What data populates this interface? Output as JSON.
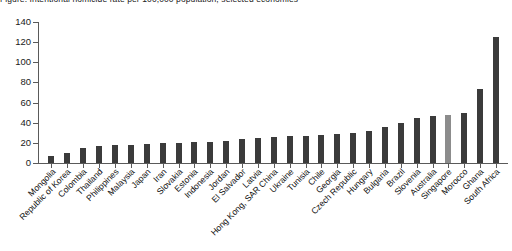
{
  "chart": {
    "title": "Figure: Intentional homicide rate per 100,000 population, selected economies",
    "axis": {
      "y_ticks": [
        0,
        20,
        40,
        60,
        80,
        100,
        120,
        140
      ],
      "ylim": [
        0,
        140
      ],
      "ylabel": "",
      "xlabel": ""
    },
    "colors": {
      "bar": "#3b3b3b",
      "bar_highlight": "#8c8c8c",
      "axis": "#5a5a5a",
      "text": "#111111",
      "background": "#ffffff"
    },
    "highlight_category": "Singapore"
  },
  "chart_data": {
    "type": "bar",
    "title": "Figure: Intentional homicide rate per 100,000 population, selected economies",
    "xlabel": "",
    "ylabel": "",
    "ylim": [
      0,
      140
    ],
    "yticks": [
      0,
      20,
      40,
      60,
      80,
      100,
      120,
      140
    ],
    "grid": false,
    "legend": "none",
    "orientation": "vertical",
    "categories": [
      "Mongolia",
      "Republic of Korea",
      "Colombia",
      "Thailand",
      "Philippines",
      "Malaysia",
      "Japan",
      "Iran",
      "Slovakia",
      "Estonia",
      "Indonesia",
      "Jordan",
      "El Salvador",
      "Latvia",
      "Hong Kong, SAR China",
      "Ukraine",
      "Tunisia",
      "Chile",
      "Georgia",
      "Czech Republic",
      "Hungary",
      "Bulgaria",
      "Brazil",
      "Slovenia",
      "Australia",
      "Singapore",
      "Morocco",
      "Ghana",
      "South Africa"
    ],
    "values": [
      7,
      10,
      15,
      17,
      18,
      18,
      19,
      20,
      20,
      21,
      21,
      22,
      24,
      25,
      26,
      27,
      27,
      28,
      29,
      30,
      32,
      36,
      40,
      45,
      47,
      48,
      50,
      73,
      125
    ],
    "highlighted": [
      "Singapore"
    ],
    "series": [
      {
        "name": "Rate",
        "values": [
          7,
          10,
          15,
          17,
          18,
          18,
          19,
          20,
          20,
          21,
          21,
          22,
          24,
          25,
          26,
          27,
          27,
          28,
          29,
          30,
          32,
          36,
          40,
          45,
          47,
          48,
          50,
          73,
          125
        ]
      }
    ]
  }
}
